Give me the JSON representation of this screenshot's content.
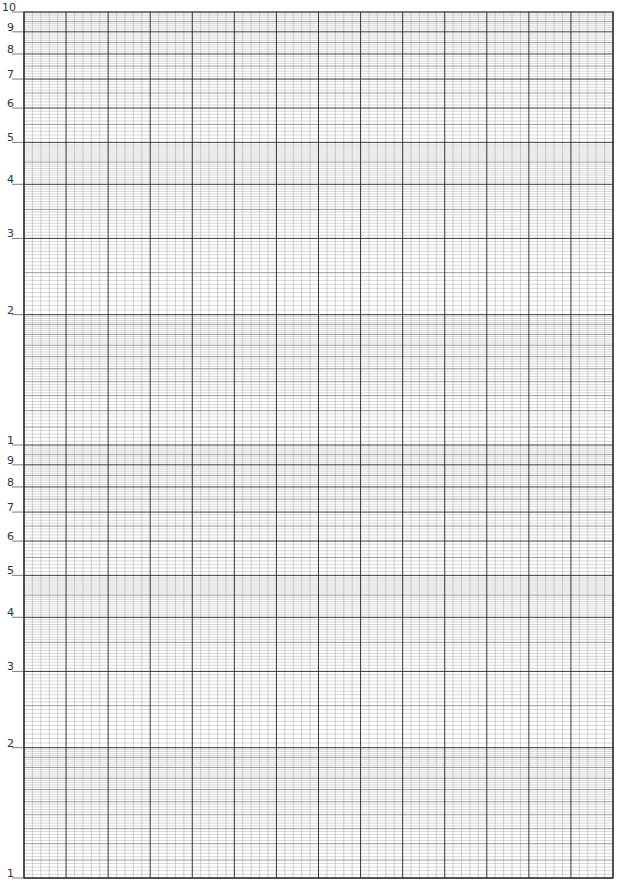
{
  "paper": {
    "type": "semi-log graph paper",
    "decades": 2,
    "cycles_label": "2-cycle semi-logarithmic",
    "colors": {
      "grid_major": "#222222",
      "grid_mid": "#555555",
      "grid_minor": "#9a9a9a",
      "label": "#333333",
      "tick": "#444444"
    }
  },
  "grid": {
    "left": 24,
    "right": 613,
    "top": 12,
    "bottom": 878,
    "vertical_divisions": 70,
    "vertical_major_every": 5
  },
  "y_axis": {
    "upper_decade_labels": [
      "10",
      "9",
      "8",
      "7",
      "6",
      "5",
      "4",
      "3",
      "2"
    ],
    "lower_decade_labels": [
      "1",
      "9",
      "8",
      "7",
      "6",
      "5",
      "4",
      "3",
      "2",
      "1"
    ],
    "tick_values_upper": [
      10,
      9,
      8,
      7,
      6,
      5,
      4,
      3,
      2
    ],
    "tick_values_lower": [
      1,
      9,
      8,
      7,
      6,
      5,
      4,
      3,
      2,
      1
    ]
  }
}
